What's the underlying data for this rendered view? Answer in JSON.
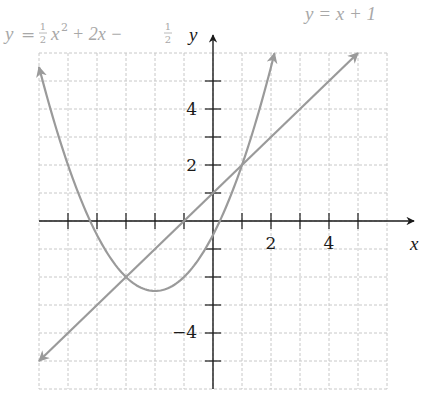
{
  "chart_data": {
    "type": "line",
    "title": "",
    "xlabel": "x",
    "ylabel": "y",
    "xlim": [
      -6,
      6
    ],
    "ylim": [
      -6,
      6
    ],
    "grid": true,
    "x_ticks": [
      -5,
      -4,
      -3,
      -2,
      -1,
      1,
      2,
      3,
      4,
      5
    ],
    "y_ticks": [
      -5,
      -4,
      -3,
      -2,
      -1,
      1,
      2,
      3,
      4,
      5
    ],
    "x_tick_labels": [
      {
        "value": 2,
        "label": "2"
      },
      {
        "value": 4,
        "label": "4"
      }
    ],
    "y_tick_labels": [
      {
        "value": 4,
        "label": "4"
      },
      {
        "value": 2,
        "label": "2"
      },
      {
        "value": -4,
        "label": "−4"
      }
    ],
    "series": [
      {
        "name": "parabola",
        "label": "y = ½x² + 2x − ½",
        "equation": "y = 1/2 x^2 + 2x - 1/2",
        "color": "#9a9a9a",
        "x_range": [
          -6,
          2.12
        ],
        "points": [
          [
            -6,
            5.5
          ],
          [
            -5,
            2
          ],
          [
            -4,
            -0.5
          ],
          [
            -3,
            -2
          ],
          [
            -2,
            -2.5
          ],
          [
            -1,
            -2
          ],
          [
            0,
            -0.5
          ],
          [
            1,
            2
          ],
          [
            2,
            5.5
          ]
        ],
        "vertex": [
          -2,
          -2.5
        ],
        "arrows": "both"
      },
      {
        "name": "line",
        "label": "y = x + 1",
        "equation": "y = x + 1",
        "color": "#9a9a9a",
        "points": [
          [
            -6,
            -5
          ],
          [
            5,
            6
          ]
        ],
        "arrows": "both"
      }
    ],
    "intersections": [
      [
        -3,
        -2
      ],
      [
        1,
        2
      ]
    ]
  },
  "labels": {
    "parabola_eq": {
      "y": "y",
      "eq": "=",
      "half": "1",
      "den": "2",
      "x": "x",
      "sq": "2",
      "rest": "+ 2x −",
      "half2": "1",
      "den2": "2"
    },
    "line_eq": "y = x + 1",
    "x_axis": "x",
    "y_axis": "y",
    "tick_x2": "2",
    "tick_x4": "4",
    "tick_y4": "4",
    "tick_y2": "2",
    "tick_ym4": "−4"
  },
  "colors": {
    "axis": "#1a1a1a",
    "grid": "#c8c8c8",
    "curve": "#9a9a9a",
    "label_light": "#a8a8a8"
  }
}
